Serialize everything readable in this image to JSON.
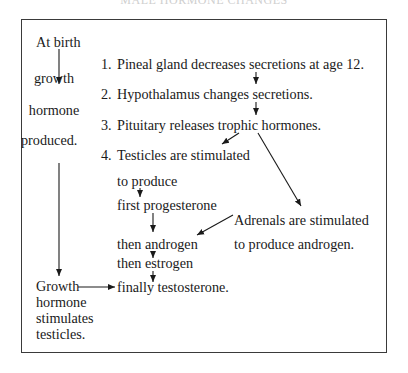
{
  "title": "MALE HORMONE CHANGES",
  "left_column": {
    "at_birth": "At birth",
    "growth": "growth",
    "hormone": "hormone",
    "produced": "produced.",
    "result": [
      "Growth",
      "hormone",
      "stimulates",
      "testicles."
    ]
  },
  "steps": [
    {
      "number": "1.",
      "text": "Pineal gland decreases secretions at age 12."
    },
    {
      "number": "2.",
      "text": "Hypothalamus changes secretions."
    },
    {
      "number": "3.",
      "text": "Pituitary releases trophic hormones."
    },
    {
      "number": "4.",
      "text": "Testicles are stimulated"
    }
  ],
  "testicle_sequence": {
    "to_produce": "to produce",
    "first": "first progesterone",
    "then_androgen": "then androgen",
    "then_estrogen": "then estrogen",
    "finally": "finally testosterone."
  },
  "adrenals": {
    "line1": "Adrenals are stimulated",
    "line2": "to produce androgen."
  },
  "colors": {
    "line": "#1a1a1a",
    "frame": "#3a3a3a",
    "background": "#ffffff"
  }
}
